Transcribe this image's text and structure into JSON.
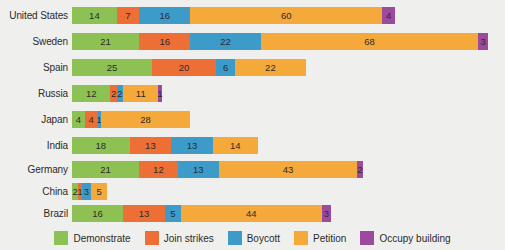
{
  "chart_data": {
    "type": "bar",
    "orientation": "horizontal",
    "stacked": true,
    "title": "",
    "subtitle": "",
    "xlabel": "",
    "ylabel": "",
    "grid": false,
    "legend_position": "bottom",
    "categories": [
      "United States",
      "Sweden",
      "Spain",
      "Russia",
      "Japan",
      "India",
      "Germany",
      "China",
      "Brazil"
    ],
    "series": [
      {
        "name": "Demonstrate",
        "color": "#8ec153",
        "values": [
          14,
          21,
          25,
          12,
          4,
          18,
          21,
          2,
          16
        ]
      },
      {
        "name": "Join strikes",
        "color": "#ee6f36",
        "values": [
          7,
          16,
          20,
          2,
          4,
          13,
          12,
          1,
          13
        ]
      },
      {
        "name": "Boycott",
        "color": "#3d9bc9",
        "values": [
          16,
          22,
          6,
          2,
          1,
          13,
          13,
          3,
          5
        ]
      },
      {
        "name": "Petition",
        "color": "#f5a93b",
        "values": [
          60,
          68,
          22,
          11,
          28,
          14,
          43,
          5,
          44
        ]
      },
      {
        "name": "Occupy building",
        "color": "#9b4a9e",
        "values": [
          4,
          3,
          0,
          1,
          0,
          0,
          2,
          0,
          3
        ]
      }
    ],
    "totals": [
      101,
      130,
      73,
      28,
      37,
      58,
      91,
      11,
      81
    ],
    "xlim": [
      0,
      130
    ],
    "units": "percent"
  },
  "legend": {
    "items": [
      {
        "label": "Demonstrate",
        "swatch": "legend-swatch-demonstrate"
      },
      {
        "label": "Join strikes",
        "swatch": "legend-swatch-join-strikes"
      },
      {
        "label": "Boycott",
        "swatch": "legend-swatch-boycott"
      },
      {
        "label": "Petition",
        "swatch": "legend-swatch-petition"
      },
      {
        "label": "Occupy building",
        "swatch": "legend-swatch-occupy-building"
      }
    ]
  },
  "colors": {
    "background": "#efefed",
    "demonstrate": "#8ec153",
    "join_strikes": "#ee6f36",
    "boycott": "#3d9bc9",
    "petition": "#f5a93b",
    "occupy_building": "#9b4a9e",
    "text": "#2b2b2b"
  }
}
